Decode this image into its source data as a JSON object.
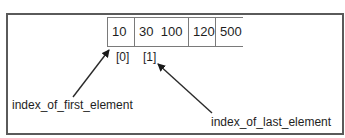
{
  "diagram": {
    "array": {
      "cells": [
        {
          "text": "10"
        },
        {
          "text": "30  100"
        },
        {
          "text": "120"
        },
        {
          "text": "500"
        }
      ]
    },
    "indices": [
      {
        "text": "[0]"
      },
      {
        "text": "[1]"
      }
    ],
    "labels": {
      "first": "index_of_first_element",
      "last": "index_of_last_element"
    },
    "arrows": [
      {
        "from_label": "index_of_first_element",
        "points_to": "array cell 10 / [0]"
      },
      {
        "from_label": "index_of_last_element",
        "points_to": "[1]"
      }
    ],
    "colors": {
      "frame": "#5a5a5a",
      "cell_lines": "#7a7a7a",
      "text": "#1e1e1e",
      "arrow": "#2a2a2a"
    }
  }
}
